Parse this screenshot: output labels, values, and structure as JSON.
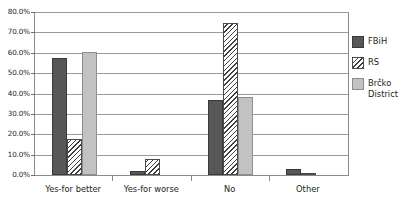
{
  "chart_data": {
    "type": "bar",
    "title": "",
    "subtitle": "",
    "xlabel": "",
    "ylabel": "",
    "ylim": [
      0,
      80
    ],
    "grid": true,
    "legend_position": "right",
    "value_format": "percent",
    "yticks": [
      "0.0%",
      "10.0%",
      "20.0%",
      "30.0%",
      "40.0%",
      "50.0%",
      "60.0%",
      "70.0%",
      "80.0%"
    ],
    "ytick_values": [
      0,
      10,
      20,
      30,
      40,
      50,
      60,
      70,
      80
    ],
    "categories": [
      "Yes-for better",
      "Yes-for worse",
      "No",
      "Other"
    ],
    "series": [
      {
        "name": "FBiH",
        "color": "#575757",
        "pattern": "solid",
        "values": [
          57.5,
          2.0,
          37.0,
          3.0
        ]
      },
      {
        "name": "RS",
        "color": "#ffffff",
        "pattern": "diagonal-hatch",
        "values": [
          17.5,
          8.0,
          74.5,
          1.0
        ]
      },
      {
        "name": "Brčko District",
        "color": "#c2c2c2",
        "pattern": "solid",
        "values": [
          60.5,
          0.0,
          38.5,
          0.0
        ]
      }
    ]
  },
  "legend": {
    "items": [
      {
        "label": "FBiH"
      },
      {
        "label": "RS"
      },
      {
        "label": "Brčko\nDistrict"
      }
    ]
  },
  "colors": {
    "fbih": "#575757",
    "rs": "#ffffff",
    "brcko": "#c2c2c2",
    "gridline": "#9a9a9a",
    "axis": "#8b8b8b",
    "text": "#231f20",
    "background": "#ffffff"
  }
}
